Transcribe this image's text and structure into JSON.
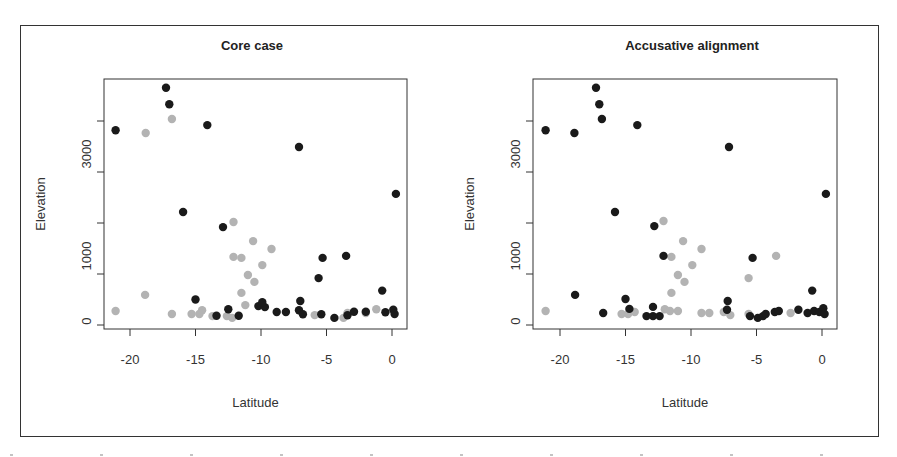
{
  "chart_data": [
    {
      "type": "scatter",
      "title": "Core case",
      "xlabel": "Latitude",
      "ylabel": "Elevation",
      "xlim": [
        -22,
        0.5
      ],
      "ylim": [
        -50,
        4800
      ],
      "xticks": [
        -20,
        -15,
        -10,
        -5,
        0
      ],
      "xtick_labels": [
        "-20",
        "-15",
        "-10",
        "-5",
        "0"
      ],
      "yticks": [
        0,
        1000,
        2000,
        3000,
        4000
      ],
      "ytick_labels": [
        {
          "value": 0,
          "label": "0"
        },
        {
          "value": 1000,
          "label": "1000"
        },
        {
          "value": 3000,
          "label": "3000"
        }
      ],
      "grid": false,
      "legend": "none",
      "series": [
        {
          "name": "black",
          "color": "#1a1a1a",
          "points": [
            [
              -21.1,
              3820
            ],
            [
              -17.25,
              4650
            ],
            [
              -17.0,
              4330
            ],
            [
              -14.1,
              3920
            ],
            [
              -7.1,
              3490
            ],
            [
              0.3,
              2570
            ],
            [
              -15.95,
              2215
            ],
            [
              -12.9,
              1920
            ],
            [
              -5.3,
              1315
            ],
            [
              -3.5,
              1355
            ],
            [
              -5.6,
              920
            ],
            [
              -0.75,
              675
            ],
            [
              -15.0,
              500
            ],
            [
              -13.4,
              180
            ],
            [
              -12.5,
              310
            ],
            [
              -11.7,
              180
            ],
            [
              -10.2,
              370
            ],
            [
              -9.7,
              350
            ],
            [
              -9.9,
              450
            ],
            [
              -8.8,
              255
            ],
            [
              -8.1,
              255
            ],
            [
              -7.0,
              470
            ],
            [
              -7.1,
              290
            ],
            [
              -6.8,
              210
            ],
            [
              -5.4,
              210
            ],
            [
              -4.4,
              140
            ],
            [
              -3.4,
              190
            ],
            [
              -2.9,
              260
            ],
            [
              -2.0,
              260
            ],
            [
              -0.5,
              250
            ],
            [
              0.1,
              300
            ],
            [
              0.2,
              215
            ]
          ]
        },
        {
          "name": "gray",
          "color": "#b3b3b3",
          "points": [
            [
              -18.8,
              3765
            ],
            [
              -16.8,
              4040
            ],
            [
              -12.1,
              2020
            ],
            [
              -10.6,
              1645
            ],
            [
              -12.1,
              1335
            ],
            [
              -11.5,
              1315
            ],
            [
              -9.2,
              1490
            ],
            [
              -9.9,
              1175
            ],
            [
              -11.0,
              980
            ],
            [
              -10.5,
              845
            ],
            [
              -18.85,
              590
            ],
            [
              -21.1,
              275
            ],
            [
              -16.8,
              215
            ],
            [
              -11.5,
              630
            ],
            [
              -11.2,
              390
            ],
            [
              -15.3,
              215
            ],
            [
              -14.7,
              215
            ],
            [
              -14.5,
              290
            ],
            [
              -13.7,
              175
            ],
            [
              -12.6,
              175
            ],
            [
              -12.2,
              140
            ],
            [
              -5.9,
              195
            ],
            [
              -3.7,
              140
            ],
            [
              -3.4,
              235
            ],
            [
              -2.0,
              235
            ],
            [
              -1.2,
              310
            ]
          ]
        }
      ]
    },
    {
      "type": "scatter",
      "title": "Accusative alignment",
      "xlabel": "Latitude",
      "ylabel": "Elevation",
      "xlim": [
        -22,
        0.5
      ],
      "ylim": [
        -50,
        4800
      ],
      "xticks": [
        -20,
        -15,
        -10,
        -5,
        0
      ],
      "xtick_labels": [
        "-20",
        "-15",
        "-10",
        "-5",
        "0"
      ],
      "yticks": [
        0,
        1000,
        2000,
        3000,
        4000
      ],
      "ytick_labels": [
        {
          "value": 0,
          "label": "0"
        },
        {
          "value": 1000,
          "label": "1000"
        },
        {
          "value": 3000,
          "label": "3000"
        }
      ],
      "grid": false,
      "legend": "none",
      "series": [
        {
          "name": "black",
          "color": "#1a1a1a",
          "points": [
            [
              -21.1,
              3820
            ],
            [
              -18.9,
              3765
            ],
            [
              -17.25,
              4650
            ],
            [
              -17.0,
              4330
            ],
            [
              -16.8,
              4040
            ],
            [
              -14.1,
              3920
            ],
            [
              -7.1,
              3490
            ],
            [
              0.3,
              2570
            ],
            [
              -15.8,
              2215
            ],
            [
              -12.8,
              1940
            ],
            [
              -12.1,
              1355
            ],
            [
              -5.3,
              1315
            ],
            [
              -0.75,
              675
            ],
            [
              -18.85,
              590
            ],
            [
              -16.7,
              235
            ],
            [
              -15.0,
              510
            ],
            [
              -14.7,
              315
            ],
            [
              -12.9,
              355
            ],
            [
              -13.4,
              175
            ],
            [
              -12.9,
              175
            ],
            [
              -12.4,
              175
            ],
            [
              -7.2,
              470
            ],
            [
              -7.25,
              300
            ],
            [
              -5.5,
              175
            ],
            [
              -4.9,
              140
            ],
            [
              -4.5,
              175
            ],
            [
              -4.3,
              215
            ],
            [
              -3.6,
              255
            ],
            [
              -3.3,
              275
            ],
            [
              -1.8,
              300
            ],
            [
              -1.1,
              235
            ],
            [
              -0.6,
              275
            ],
            [
              -0.2,
              255
            ],
            [
              0.1,
              330
            ],
            [
              0.2,
              215
            ]
          ]
        },
        {
          "name": "gray",
          "color": "#b3b3b3",
          "points": [
            [
              -21.1,
              275
            ],
            [
              -12.1,
              2040
            ],
            [
              -10.6,
              1645
            ],
            [
              -11.5,
              1335
            ],
            [
              -9.2,
              1490
            ],
            [
              -9.9,
              1175
            ],
            [
              -11.0,
              980
            ],
            [
              -10.5,
              845
            ],
            [
              -3.5,
              1355
            ],
            [
              -5.6,
              920
            ],
            [
              -11.5,
              630
            ],
            [
              -15.3,
              215
            ],
            [
              -14.8,
              215
            ],
            [
              -14.3,
              255
            ],
            [
              -12.0,
              310
            ],
            [
              -11.6,
              275
            ],
            [
              -11.0,
              275
            ],
            [
              -9.2,
              235
            ],
            [
              -8.6,
              235
            ],
            [
              -7.5,
              255
            ],
            [
              -7.0,
              195
            ],
            [
              -5.6,
              215
            ],
            [
              -2.4,
              235
            ]
          ]
        }
      ]
    }
  ],
  "figure": {
    "footer_text": ""
  }
}
